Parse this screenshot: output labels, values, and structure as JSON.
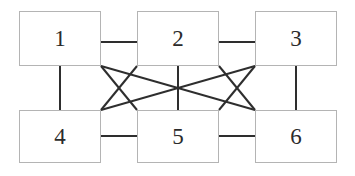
{
  "diagram": {
    "canvas": {
      "width": 355,
      "height": 176
    },
    "style": {
      "background_color": "#ffffff",
      "node_fill_color": "#ffffff",
      "node_border_color": "#b4b4b4",
      "node_border_width": 1,
      "edge_color": "#2e2e2e",
      "edge_width": 2,
      "label_color": "#2b2b2b",
      "label_font_size": 23
    },
    "nodes": [
      {
        "id": "node-1",
        "label": "1",
        "x": 19,
        "y": 11,
        "width": 82,
        "height": 55,
        "row": "top",
        "column": "left"
      },
      {
        "id": "node-2",
        "label": "2",
        "x": 137,
        "y": 11,
        "width": 82,
        "height": 55,
        "row": "top",
        "column": "center"
      },
      {
        "id": "node-3",
        "label": "3",
        "x": 255,
        "y": 11,
        "width": 82,
        "height": 55,
        "row": "top",
        "column": "right"
      },
      {
        "id": "node-4",
        "label": "4",
        "x": 19,
        "y": 110,
        "width": 82,
        "height": 53,
        "row": "bottom",
        "column": "left"
      },
      {
        "id": "node-5",
        "label": "5",
        "x": 137,
        "y": 110,
        "width": 82,
        "height": 53,
        "row": "bottom",
        "column": "center"
      },
      {
        "id": "node-6",
        "label": "6",
        "x": 255,
        "y": 110,
        "width": 82,
        "height": 53,
        "row": "bottom",
        "column": "right"
      }
    ],
    "edges": [
      {
        "id": "edge-1-2",
        "from": "node-1",
        "to": "node-2",
        "kind": "horizontal",
        "x1": 101,
        "y1": 42,
        "x2": 137,
        "y2": 42
      },
      {
        "id": "edge-2-3",
        "from": "node-2",
        "to": "node-3",
        "kind": "horizontal",
        "x1": 219,
        "y1": 42,
        "x2": 255,
        "y2": 42
      },
      {
        "id": "edge-4-5",
        "from": "node-4",
        "to": "node-5",
        "kind": "horizontal",
        "x1": 101,
        "y1": 136,
        "x2": 137,
        "y2": 136
      },
      {
        "id": "edge-5-6",
        "from": "node-5",
        "to": "node-6",
        "kind": "horizontal",
        "x1": 219,
        "y1": 136,
        "x2": 255,
        "y2": 136
      },
      {
        "id": "edge-1-4",
        "from": "node-1",
        "to": "node-4",
        "kind": "vertical",
        "x1": 60,
        "y1": 66,
        "x2": 60,
        "y2": 110
      },
      {
        "id": "edge-2-5",
        "from": "node-2",
        "to": "node-5",
        "kind": "vertical",
        "x1": 178,
        "y1": 66,
        "x2": 178,
        "y2": 110
      },
      {
        "id": "edge-3-6",
        "from": "node-3",
        "to": "node-6",
        "kind": "vertical",
        "x1": 296,
        "y1": 66,
        "x2": 296,
        "y2": 110
      },
      {
        "id": "edge-1-5",
        "from": "node-1",
        "to": "node-5",
        "kind": "diagonal",
        "x1": 101,
        "y1": 66,
        "x2": 137,
        "y2": 110
      },
      {
        "id": "edge-4-2",
        "from": "node-4",
        "to": "node-2",
        "kind": "diagonal",
        "x1": 101,
        "y1": 110,
        "x2": 137,
        "y2": 66
      },
      {
        "id": "edge-2-6",
        "from": "node-2",
        "to": "node-6",
        "kind": "diagonal",
        "x1": 219,
        "y1": 66,
        "x2": 255,
        "y2": 110
      },
      {
        "id": "edge-5-3",
        "from": "node-5",
        "to": "node-3",
        "kind": "diagonal",
        "x1": 219,
        "y1": 110,
        "x2": 255,
        "y2": 66
      },
      {
        "id": "edge-1-6",
        "from": "node-1",
        "to": "node-6",
        "kind": "long-diagonal",
        "x1": 101,
        "y1": 66,
        "x2": 255,
        "y2": 110
      },
      {
        "id": "edge-4-3",
        "from": "node-4",
        "to": "node-3",
        "kind": "long-diagonal",
        "x1": 101,
        "y1": 110,
        "x2": 255,
        "y2": 66
      }
    ]
  }
}
